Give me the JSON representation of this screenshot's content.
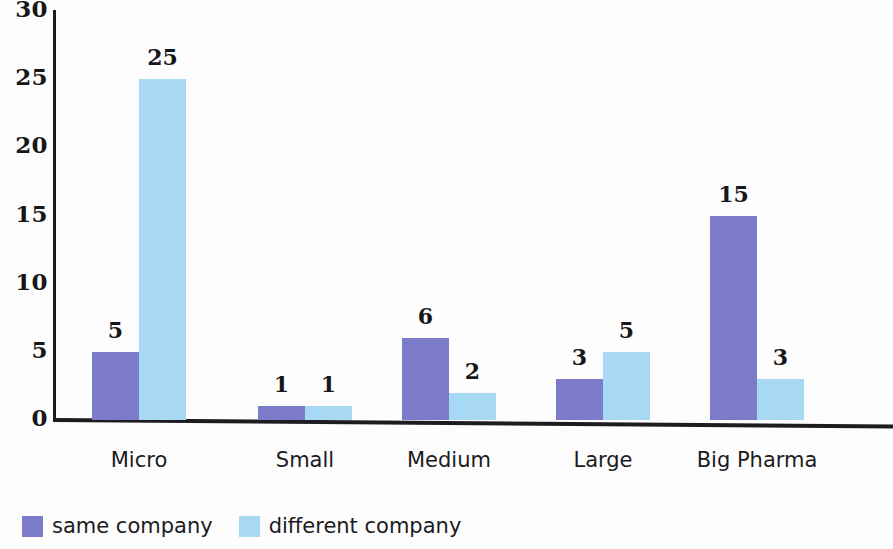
{
  "chart_data": {
    "type": "bar",
    "title": "",
    "subtitle": "",
    "xlabel": "",
    "ylabel": "",
    "ylim": [
      0,
      30
    ],
    "yticks": [
      0,
      5,
      10,
      15,
      20,
      25,
      30
    ],
    "grid": false,
    "legend_position": "bottom-left",
    "categories": [
      "Micro",
      "Small",
      "Medium",
      "Large",
      "Big Pharma"
    ],
    "series": [
      {
        "name": "same company",
        "color": "#7b7bc9",
        "values": [
          5,
          1,
          6,
          3,
          15
        ]
      },
      {
        "name": "different company",
        "color": "#a7d9f4",
        "values": [
          25,
          1,
          2,
          5,
          3
        ]
      }
    ]
  },
  "legend": {
    "entries": [
      {
        "label": "same company",
        "color": "#7b7bc9"
      },
      {
        "label": "different company",
        "color": "#a7d9f4"
      }
    ]
  }
}
